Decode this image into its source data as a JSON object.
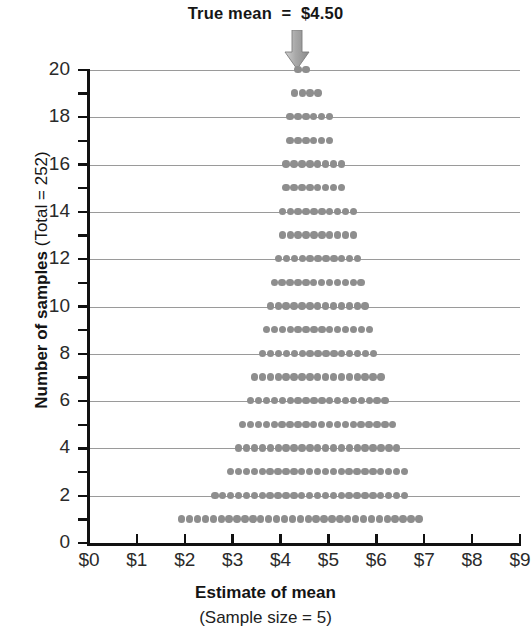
{
  "annotation": {
    "true_mean_text": "True mean  =  $4.50",
    "arrow_icon": "down-arrow-icon",
    "arrow_value": 4.35
  },
  "axes": {
    "y": {
      "title_bold": "Number of samples ",
      "title_normal": "(Total = 252)",
      "min": 0,
      "max": 20,
      "tick_values": [
        0,
        2,
        4,
        6,
        8,
        10,
        12,
        14,
        16,
        18,
        20
      ],
      "tick_labels": [
        "0",
        "2",
        "4",
        "6",
        "8",
        "10",
        "12",
        "14",
        "16",
        "18",
        "20"
      ],
      "minor_tick_values": [
        1,
        3,
        5,
        7,
        9,
        11,
        13,
        15,
        17,
        19
      ]
    },
    "x": {
      "title": "Estimate of mean",
      "subtitle": "(Sample size = 5)",
      "min": 0,
      "max": 9,
      "tick_values": [
        0,
        1,
        2,
        3,
        4,
        5,
        6,
        7,
        8,
        9
      ],
      "tick_labels": [
        "$0",
        "$1",
        "$2",
        "$3",
        "$4",
        "$5",
        "$6",
        "$7",
        "$8",
        "$9"
      ]
    }
  },
  "style": {
    "dot_color": "#8e8e8e",
    "gridline_color": "#9a9a9a",
    "axis_color": "#111111",
    "text_color": "#1a1a1a",
    "background": "#ffffff"
  },
  "chart_data": {
    "type": "scatter",
    "title": "True mean  =  $4.50",
    "xlabel": "Estimate of mean (Sample size = 5)",
    "ylabel": "Number of samples (Total = 252)",
    "xlim": [
      0,
      9
    ],
    "ylim": [
      0,
      20
    ],
    "grid": true,
    "legend": "none",
    "dot_spacing_dollars": 0.165,
    "total_samples": 252,
    "rows": [
      {
        "level": 20,
        "count": 2,
        "start": 4.29,
        "dots": 2
      },
      {
        "level": 19,
        "count": 4,
        "start": 4.21,
        "dots": 4
      },
      {
        "level": 18,
        "count": 6,
        "start": 4.12,
        "dots": 6
      },
      {
        "level": 17,
        "count": 6,
        "start": 4.12,
        "dots": 6
      },
      {
        "level": 16,
        "count": 8,
        "start": 4.04,
        "dots": 8
      },
      {
        "level": 15,
        "count": 8,
        "start": 4.04,
        "dots": 8
      },
      {
        "level": 14,
        "count": 10,
        "start": 3.96,
        "dots": 10
      },
      {
        "level": 13,
        "count": 10,
        "start": 3.96,
        "dots": 10
      },
      {
        "level": 12,
        "count": 11,
        "start": 3.88,
        "dots": 11
      },
      {
        "level": 11,
        "count": 12,
        "start": 3.79,
        "dots": 12
      },
      {
        "level": 10,
        "count": 13,
        "start": 3.71,
        "dots": 13
      },
      {
        "level": 9,
        "count": 14,
        "start": 3.63,
        "dots": 14
      },
      {
        "level": 8,
        "count": 15,
        "start": 3.55,
        "dots": 15
      },
      {
        "level": 7,
        "count": 17,
        "start": 3.38,
        "dots": 17
      },
      {
        "level": 6,
        "count": 18,
        "start": 3.3,
        "dots": 18
      },
      {
        "level": 5,
        "count": 20,
        "start": 3.13,
        "dots": 20
      },
      {
        "level": 4,
        "count": 21,
        "start": 3.05,
        "dots": 21
      },
      {
        "level": 3,
        "count": 23,
        "start": 2.88,
        "dots": 23
      },
      {
        "level": 2,
        "count": 25,
        "start": 2.55,
        "dots": 25
      },
      {
        "level": 1,
        "count": 31,
        "start": 1.86,
        "dots": 31
      }
    ]
  }
}
